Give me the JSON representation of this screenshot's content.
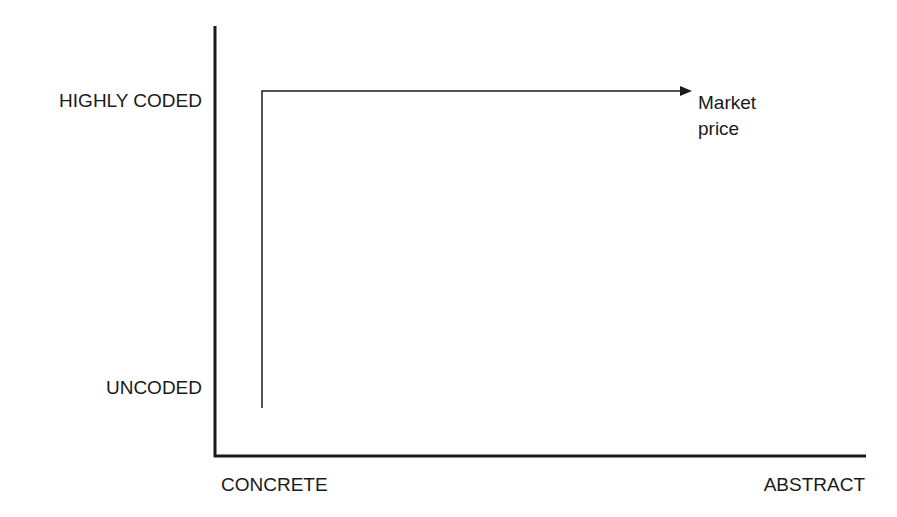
{
  "diagram": {
    "y_axis": {
      "top_label": "HIGHLY CODED",
      "bottom_label": "UNCODED"
    },
    "x_axis": {
      "left_label": "CONCRETE",
      "right_label": "ABSTRACT"
    },
    "path": {
      "end_label_line1": "Market",
      "end_label_line2": "price"
    },
    "colors": {
      "line": "#1a1a1a",
      "background": "#ffffff"
    }
  }
}
